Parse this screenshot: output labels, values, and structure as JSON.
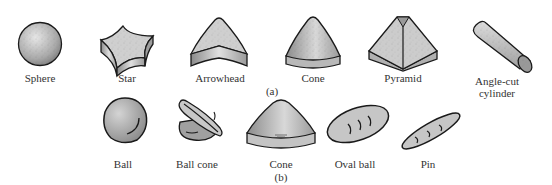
{
  "figure": {
    "row_a": {
      "caption": "(a)",
      "items": [
        {
          "label": "Sphere"
        },
        {
          "label": "Star"
        },
        {
          "label": "Arrowhead"
        },
        {
          "label": "Cone"
        },
        {
          "label": "Pyramid"
        },
        {
          "label_line1": "Angle-cut",
          "label_line2": "cylinder"
        }
      ]
    },
    "row_b": {
      "caption": "(b)",
      "items": [
        {
          "label": "Ball"
        },
        {
          "label": "Ball cone"
        },
        {
          "label": "Cone"
        },
        {
          "label": "Oval ball"
        },
        {
          "label": "Pin"
        }
      ]
    },
    "colors": {
      "outline": "#1a1a1a",
      "fill_light": "#d6d6d6",
      "fill_mid": "#a8a8a8",
      "fill_dark": "#7a7a7a"
    }
  }
}
